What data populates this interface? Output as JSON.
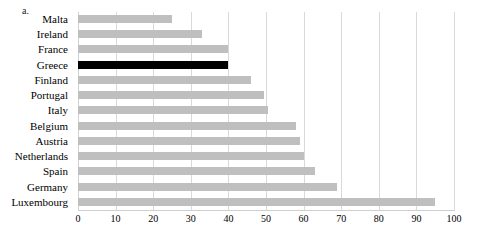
{
  "panel": {
    "label": "a."
  },
  "chart_data": {
    "type": "bar",
    "orientation": "horizontal",
    "title": "",
    "subtitle": "",
    "xlabel": "",
    "ylabel": "",
    "xlim": [
      0,
      100
    ],
    "ylim": null,
    "grid": true,
    "legend": null,
    "xticks": [
      0,
      10,
      20,
      30,
      40,
      50,
      60,
      70,
      80,
      90,
      100
    ],
    "xtick_labels": [
      "0",
      "10",
      "20",
      "30",
      "40",
      "50",
      "60",
      "70",
      "80",
      "90",
      "100"
    ],
    "categories": [
      "Malta",
      "Ireland",
      "France",
      "Greece",
      "Finland",
      "Portugal",
      "Italy",
      "Belgium",
      "Austria",
      "Netherlands",
      "Spain",
      "Germany",
      "Luxembourg"
    ],
    "values": [
      25,
      33,
      40,
      40,
      46,
      49.5,
      50.5,
      58,
      59,
      60,
      63,
      69,
      95
    ],
    "highlight_category": "Greece",
    "colors": {
      "bar": "#bfbfbf",
      "highlight": "#000000",
      "gridline": "#d9d9d9",
      "axis": "#cfcfcf",
      "text": "#000000",
      "background": "#ffffff"
    }
  }
}
